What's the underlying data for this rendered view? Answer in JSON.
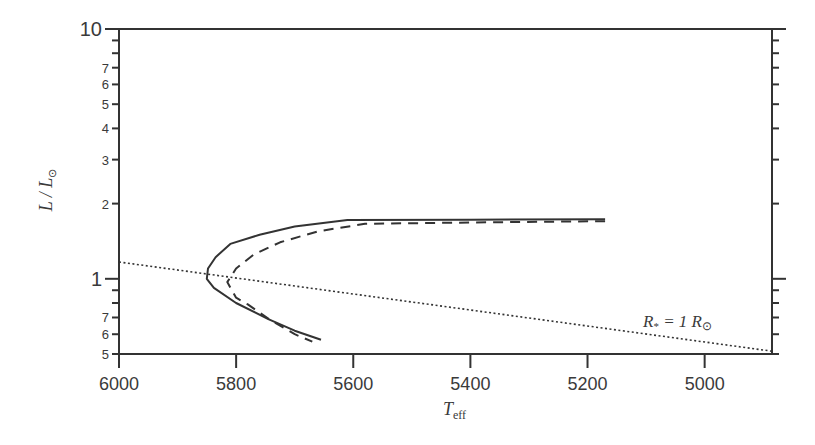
{
  "chart_data": {
    "type": "line",
    "title": "",
    "xlabel": "T",
    "xlabel_sub": "eff",
    "ylabel": "L / L",
    "ylabel_sun_symbol": "⊙",
    "x_reversed": true,
    "xlim": [
      6000,
      4885
    ],
    "ylim": [
      0.5,
      10
    ],
    "y_scale": "log",
    "grid": false,
    "x_ticks": [
      6000,
      5800,
      5600,
      5400,
      5200,
      5000
    ],
    "x_tick_labels": [
      "6000",
      "5800",
      "5600",
      "5400",
      "5200",
      "5000"
    ],
    "y_major_ticks": [
      1,
      10
    ],
    "y_major_labels": [
      "1",
      "10"
    ],
    "y_minor_ticks": [
      0.5,
      0.6,
      0.7,
      0.8,
      0.9,
      2,
      3,
      4,
      5,
      6,
      7,
      8,
      9
    ],
    "y_minor_labels": [
      "5",
      "6",
      "7",
      "",
      "",
      "2",
      "3",
      "4",
      "5",
      "6",
      "7",
      "",
      ""
    ],
    "series": [
      {
        "name": "solid-track",
        "style": "solid",
        "x": [
          5170,
          5400,
          5610,
          5700,
          5760,
          5810,
          5835,
          5848,
          5850,
          5838,
          5800,
          5745,
          5700,
          5655
        ],
        "y": [
          1.73,
          1.725,
          1.72,
          1.62,
          1.5,
          1.38,
          1.22,
          1.1,
          1.0,
          0.92,
          0.8,
          0.69,
          0.62,
          0.57
        ]
      },
      {
        "name": "dashed-track",
        "style": "dashed",
        "x": [
          5170,
          5400,
          5580,
          5660,
          5725,
          5770,
          5800,
          5815,
          5800,
          5780,
          5740,
          5700,
          5670
        ],
        "y": [
          1.7,
          1.68,
          1.66,
          1.55,
          1.4,
          1.25,
          1.1,
          0.97,
          0.84,
          0.79,
          0.68,
          0.6,
          0.56
        ]
      },
      {
        "name": "constant-radius-line",
        "style": "dotted",
        "x": [
          6000,
          4885
        ],
        "y": [
          1.167,
          0.513
        ]
      }
    ],
    "annotations": [
      {
        "text": "R",
        "sub": "*",
        "rest": " = 1 R",
        "sun": "⊙",
        "x": 5100,
        "y": 0.75
      }
    ]
  }
}
